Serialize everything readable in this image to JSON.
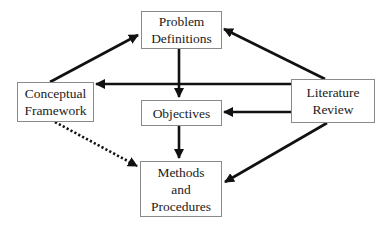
{
  "diagram": {
    "type": "flow",
    "nodes": [
      {
        "id": "problem",
        "lines": [
          "Problem",
          "Definitions"
        ]
      },
      {
        "id": "conceptual",
        "lines": [
          "Conceptual",
          "Framework"
        ]
      },
      {
        "id": "objectives",
        "lines": [
          "Objectives"
        ]
      },
      {
        "id": "literature",
        "lines": [
          "Literature",
          "Review"
        ]
      },
      {
        "id": "methods",
        "lines": [
          "Methods",
          "and",
          "Procedures"
        ]
      }
    ],
    "edges": [
      {
        "from": "conceptual",
        "to": "problem",
        "style": "solid"
      },
      {
        "from": "literature",
        "to": "problem",
        "style": "solid"
      },
      {
        "from": "literature",
        "to": "conceptual",
        "style": "solid"
      },
      {
        "from": "problem",
        "to": "objectives",
        "style": "solid"
      },
      {
        "from": "literature",
        "to": "objectives",
        "style": "solid"
      },
      {
        "from": "objectives",
        "to": "methods",
        "style": "solid"
      },
      {
        "from": "literature",
        "to": "methods",
        "style": "solid"
      },
      {
        "from": "conceptual",
        "to": "methods",
        "style": "dotted"
      }
    ],
    "colors": {
      "edge": "#111111",
      "node_border": "#8a8a8a",
      "text": "#222222",
      "background": "#ffffff"
    }
  }
}
